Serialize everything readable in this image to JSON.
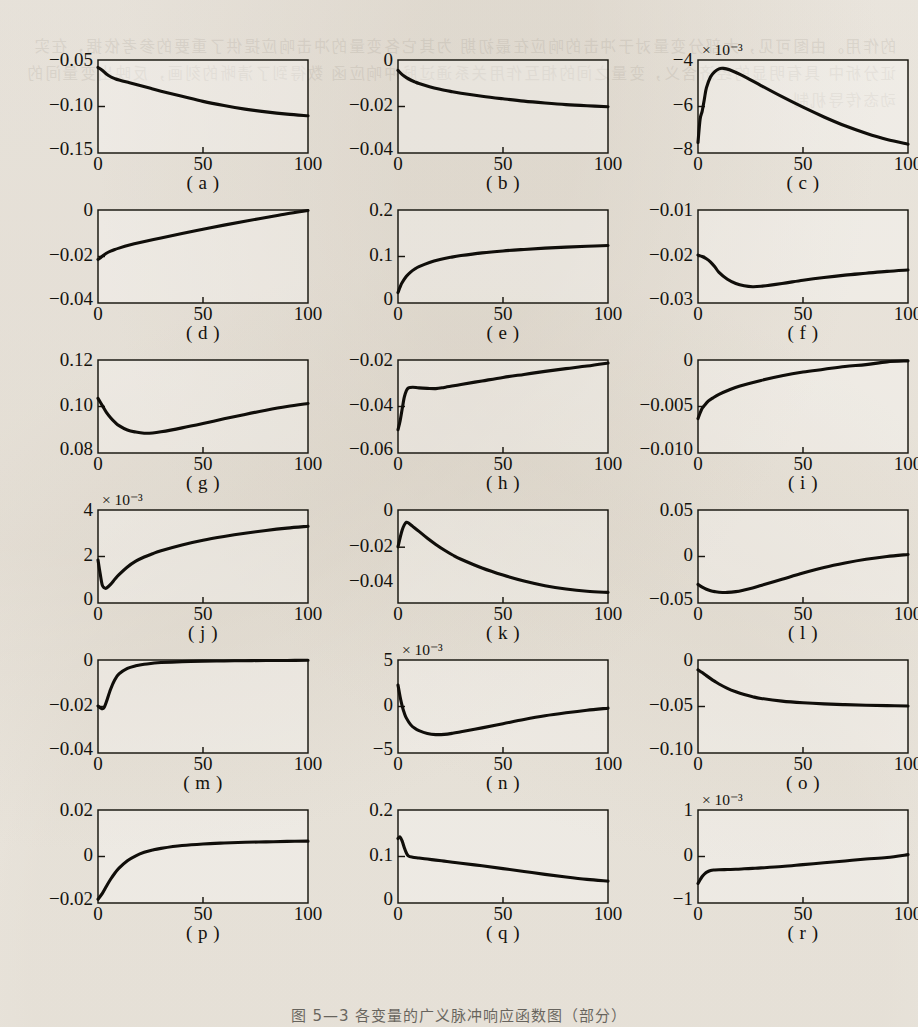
{
  "document": {
    "page_kind": "scanned-book-figure-page",
    "background_color": "#f2efe9",
    "ink_color": "#100e0a",
    "bleed_through_text": "的作用。由图可见，大部分变量对于冲击的响应在最初期 为其它各变量的冲击响应提供了重要的参考依据，在实证分析中 具有明显的经济含义，变量之间的相互作用关系通过脉冲响应函 数得到了清晰的刻画，反映出变量间的动态传导机制",
    "figure_caption": "图 5—3 各变量的广义脉冲响应函数图（部分）"
  },
  "figure": {
    "columns": 3,
    "rows": 6,
    "panel_count": 18,
    "shared_xlabel_ticks": [
      "0",
      "50",
      "100"
    ],
    "xlim": [
      0,
      100
    ]
  },
  "chart_data": [
    {
      "id": "a",
      "type": "line",
      "caption": "( a )",
      "title": "",
      "xlabel": "",
      "ylabel": "",
      "xlim": [
        0,
        100
      ],
      "ylim": [
        -0.15,
        -0.05
      ],
      "xticks": [
        "0",
        "50",
        "100"
      ],
      "yticks": [
        "-0.05",
        "-0.10",
        "-0.15"
      ],
      "ytick_values": [
        -0.05,
        -0.1,
        -0.15
      ],
      "exponent": "",
      "grid": false,
      "legend": null,
      "x": [
        0,
        2,
        4,
        6,
        8,
        10,
        15,
        20,
        25,
        30,
        40,
        50,
        60,
        70,
        80,
        90,
        100
      ],
      "y": [
        -0.058,
        -0.061,
        -0.065,
        -0.068,
        -0.07,
        -0.0715,
        -0.0745,
        -0.0775,
        -0.0805,
        -0.0835,
        -0.089,
        -0.0945,
        -0.099,
        -0.1028,
        -0.1058,
        -0.1082,
        -0.11
      ]
    },
    {
      "id": "b",
      "type": "line",
      "caption": "( b )",
      "title": "",
      "xlabel": "",
      "ylabel": "",
      "xlim": [
        0,
        100
      ],
      "ylim": [
        -0.04,
        0
      ],
      "xticks": [
        "0",
        "50",
        "100"
      ],
      "yticks": [
        "0",
        "-0.02",
        "-0.04"
      ],
      "ytick_values": [
        0,
        -0.02,
        -0.04
      ],
      "exponent": "",
      "grid": false,
      "legend": null,
      "x": [
        0,
        2,
        4,
        6,
        8,
        10,
        15,
        20,
        25,
        30,
        40,
        50,
        60,
        70,
        80,
        90,
        100
      ],
      "y": [
        -0.0045,
        -0.0063,
        -0.0076,
        -0.0086,
        -0.0094,
        -0.0101,
        -0.0115,
        -0.0126,
        -0.0135,
        -0.0143,
        -0.0156,
        -0.0167,
        -0.0177,
        -0.0185,
        -0.0192,
        -0.0197,
        -0.0201
      ]
    },
    {
      "id": "c",
      "type": "line",
      "caption": "( c )",
      "title": "",
      "xlabel": "",
      "ylabel": "",
      "xlim": [
        0,
        100
      ],
      "ylim": [
        -8,
        -4
      ],
      "xticks": [
        "0",
        "50",
        "100"
      ],
      "yticks": [
        "-4",
        "-6",
        "-8"
      ],
      "ytick_values": [
        -4,
        -6,
        -8
      ],
      "exponent": "× 10⁻³",
      "grid": false,
      "legend": null,
      "x": [
        0,
        1,
        2,
        3,
        4,
        6,
        8,
        10,
        12,
        15,
        20,
        25,
        30,
        40,
        50,
        60,
        70,
        80,
        90,
        100
      ],
      "y": [
        -7.55,
        -6.55,
        -6.2,
        -5.7,
        -5.2,
        -4.72,
        -4.5,
        -4.38,
        -4.36,
        -4.42,
        -4.62,
        -4.85,
        -5.1,
        -5.58,
        -6.03,
        -6.45,
        -6.83,
        -7.15,
        -7.42,
        -7.62
      ]
    },
    {
      "id": "d",
      "type": "line",
      "caption": "( d )",
      "title": "",
      "xlabel": "",
      "ylabel": "",
      "xlim": [
        0,
        100
      ],
      "ylim": [
        -0.04,
        0
      ],
      "xticks": [
        "0",
        "50",
        "100"
      ],
      "yticks": [
        "0",
        "-0.02",
        "-0.04"
      ],
      "ytick_values": [
        0,
        -0.02,
        -0.04
      ],
      "exponent": "",
      "grid": false,
      "legend": null,
      "x": [
        0,
        1,
        2,
        4,
        6,
        8,
        10,
        15,
        20,
        30,
        40,
        50,
        60,
        70,
        80,
        90,
        100
      ],
      "y": [
        -0.0213,
        -0.0207,
        -0.0199,
        -0.0186,
        -0.0177,
        -0.017,
        -0.0164,
        -0.0151,
        -0.014,
        -0.012,
        -0.0101,
        -0.0083,
        -0.0065,
        -0.0048,
        -0.0032,
        -0.0016,
        -0.0002
      ]
    },
    {
      "id": "e",
      "type": "line",
      "caption": "( e )",
      "title": "",
      "xlabel": "",
      "ylabel": "",
      "xlim": [
        0,
        100
      ],
      "ylim": [
        0,
        0.2
      ],
      "xticks": [
        "0",
        "50",
        "100"
      ],
      "yticks": [
        "0.2",
        "0.1",
        "0"
      ],
      "ytick_values": [
        0.2,
        0.1,
        0
      ],
      "exponent": "",
      "grid": false,
      "legend": null,
      "x": [
        0,
        1,
        2,
        4,
        6,
        8,
        10,
        15,
        20,
        25,
        30,
        40,
        50,
        60,
        70,
        80,
        90,
        100
      ],
      "y": [
        0.0225,
        0.0345,
        0.044,
        0.0575,
        0.0665,
        0.073,
        0.0782,
        0.0872,
        0.0935,
        0.0982,
        0.102,
        0.1078,
        0.112,
        0.1152,
        0.118,
        0.1202,
        0.122,
        0.1235
      ]
    },
    {
      "id": "f",
      "type": "line",
      "caption": "( f )",
      "title": "",
      "xlabel": "",
      "ylabel": "",
      "xlim": [
        0,
        100
      ],
      "ylim": [
        -0.03,
        -0.01
      ],
      "xticks": [
        "0",
        "50",
        "100"
      ],
      "yticks": [
        "-0.01",
        "-0.02",
        "-0.03"
      ],
      "ytick_values": [
        -0.01,
        -0.02,
        -0.03
      ],
      "exponent": "",
      "grid": false,
      "legend": null,
      "x": [
        0,
        2,
        4,
        6,
        8,
        10,
        14,
        18,
        22,
        26,
        30,
        40,
        50,
        60,
        70,
        80,
        90,
        100
      ],
      "y": [
        -0.0197,
        -0.02,
        -0.0205,
        -0.0212,
        -0.0222,
        -0.0234,
        -0.0249,
        -0.0258,
        -0.0263,
        -0.0265,
        -0.0264,
        -0.0258,
        -0.0251,
        -0.0245,
        -0.024,
        -0.0236,
        -0.0232,
        -0.0229
      ]
    },
    {
      "id": "g",
      "type": "line",
      "caption": "( g )",
      "title": "",
      "xlabel": "",
      "ylabel": "",
      "xlim": [
        0,
        100
      ],
      "ylim": [
        0.08,
        0.12
      ],
      "xticks": [
        "0",
        "50",
        "100"
      ],
      "yticks": [
        "0.12",
        "0.10",
        "0.08"
      ],
      "ytick_values": [
        0.12,
        0.1,
        0.08
      ],
      "exponent": "",
      "grid": false,
      "legend": null,
      "x": [
        0,
        2,
        4,
        6,
        8,
        10,
        14,
        18,
        22,
        26,
        30,
        40,
        50,
        60,
        70,
        80,
        90,
        100
      ],
      "y": [
        0.1035,
        0.1005,
        0.0975,
        0.0952,
        0.0933,
        0.0918,
        0.0899,
        0.089,
        0.0885,
        0.0886,
        0.0891,
        0.0908,
        0.0927,
        0.0947,
        0.0966,
        0.0984,
        0.1,
        0.1013
      ]
    },
    {
      "id": "h",
      "type": "line",
      "caption": "( h )",
      "title": "",
      "xlabel": "",
      "ylabel": "",
      "xlim": [
        0,
        100
      ],
      "ylim": [
        -0.06,
        -0.02
      ],
      "xticks": [
        "0",
        "50",
        "100"
      ],
      "yticks": [
        "-0.02",
        "-0.04",
        "-0.06"
      ],
      "ytick_values": [
        -0.02,
        -0.04,
        -0.06
      ],
      "exponent": "",
      "grid": false,
      "legend": null,
      "x": [
        0,
        1,
        2,
        3,
        4,
        5,
        7,
        10,
        14,
        18,
        22,
        30,
        40,
        50,
        60,
        70,
        80,
        90,
        100
      ],
      "y": [
        -0.05,
        -0.0462,
        -0.041,
        -0.036,
        -0.0332,
        -0.032,
        -0.0317,
        -0.032,
        -0.0322,
        -0.0323,
        -0.0318,
        -0.0305,
        -0.029,
        -0.0275,
        -0.0262,
        -0.0249,
        -0.0237,
        -0.0226,
        -0.0213
      ]
    },
    {
      "id": "i",
      "type": "line",
      "caption": "( i )",
      "title": "",
      "xlabel": "",
      "ylabel": "",
      "xlim": [
        0,
        100
      ],
      "ylim": [
        -0.01,
        0
      ],
      "xticks": [
        "0",
        "50",
        "100"
      ],
      "yticks": [
        "0",
        "-0.005",
        "-0.010"
      ],
      "ytick_values": [
        0,
        -0.005,
        -0.01
      ],
      "exponent": "",
      "grid": false,
      "legend": null,
      "x": [
        0,
        1,
        2,
        3,
        5,
        7,
        10,
        15,
        20,
        30,
        40,
        50,
        60,
        70,
        80,
        90,
        100
      ],
      "y": [
        -0.0063,
        -0.0057,
        -0.0052,
        -0.0049,
        -0.0044,
        -0.0041,
        -0.0037,
        -0.0032,
        -0.0028,
        -0.0022,
        -0.0017,
        -0.0013,
        -0.001,
        -0.0007,
        -0.0005,
        -0.0002,
        -0.0001
      ]
    },
    {
      "id": "j",
      "type": "line",
      "caption": "( j )",
      "title": "",
      "xlabel": "",
      "ylabel": "",
      "xlim": [
        0,
        100
      ],
      "ylim": [
        0,
        4
      ],
      "xticks": [
        "0",
        "50",
        "100"
      ],
      "yticks": [
        "4",
        "2",
        "0"
      ],
      "ytick_values": [
        4,
        2,
        0
      ],
      "exponent": "× 10⁻³",
      "grid": false,
      "legend": null,
      "x": [
        0,
        1,
        2,
        3,
        4,
        6,
        8,
        10,
        14,
        18,
        22,
        26,
        30,
        40,
        50,
        60,
        70,
        80,
        90,
        100
      ],
      "y": [
        1.85,
        1.28,
        0.78,
        0.65,
        0.64,
        0.8,
        1.02,
        1.22,
        1.55,
        1.8,
        1.98,
        2.12,
        2.25,
        2.5,
        2.7,
        2.86,
        3.0,
        3.12,
        3.22,
        3.3
      ]
    },
    {
      "id": "k",
      "type": "line",
      "caption": "( k )",
      "title": "",
      "xlabel": "",
      "ylabel": "",
      "xlim": [
        0,
        100
      ],
      "ylim": [
        -0.05,
        0
      ],
      "xticks": [
        "0",
        "50",
        "100"
      ],
      "yticks": [
        "0",
        "-0.02",
        "-0.04"
      ],
      "ytick_values": [
        0,
        -0.02,
        -0.04
      ],
      "exponent": "",
      "grid": false,
      "legend": null,
      "x": [
        0,
        1,
        2,
        3,
        4,
        5,
        7,
        10,
        14,
        18,
        22,
        26,
        30,
        40,
        50,
        60,
        70,
        80,
        90,
        100
      ],
      "y": [
        -0.0198,
        -0.015,
        -0.0108,
        -0.008,
        -0.0066,
        -0.007,
        -0.0088,
        -0.0115,
        -0.0152,
        -0.0185,
        -0.0215,
        -0.0242,
        -0.0265,
        -0.0312,
        -0.035,
        -0.0382,
        -0.0407,
        -0.0425,
        -0.0437,
        -0.0443
      ]
    },
    {
      "id": "l",
      "type": "line",
      "caption": "( l )",
      "title": "",
      "xlabel": "",
      "ylabel": "",
      "xlim": [
        0,
        100
      ],
      "ylim": [
        -0.05,
        0.05
      ],
      "xticks": [
        "0",
        "50",
        "100"
      ],
      "yticks": [
        "0.05",
        "0",
        "-0.05"
      ],
      "ytick_values": [
        0.05,
        0,
        -0.05
      ],
      "exponent": "",
      "grid": false,
      "legend": null,
      "x": [
        0,
        2,
        4,
        6,
        8,
        10,
        14,
        18,
        22,
        26,
        30,
        40,
        50,
        60,
        70,
        80,
        90,
        100
      ],
      "y": [
        -0.03,
        -0.033,
        -0.0352,
        -0.0368,
        -0.0378,
        -0.0384,
        -0.0386,
        -0.0378,
        -0.036,
        -0.0338,
        -0.0312,
        -0.0245,
        -0.0178,
        -0.0118,
        -0.007,
        -0.003,
        0.0,
        0.0022
      ]
    },
    {
      "id": "m",
      "type": "line",
      "caption": "( m )",
      "title": "",
      "xlabel": "",
      "ylabel": "",
      "xlim": [
        0,
        100
      ],
      "ylim": [
        -0.04,
        0
      ],
      "xticks": [
        "0",
        "50",
        "100"
      ],
      "yticks": [
        "0",
        "-0.02",
        "-0.04"
      ],
      "ytick_values": [
        0,
        -0.02,
        -0.04
      ],
      "exponent": "",
      "grid": false,
      "legend": null,
      "x": [
        0,
        1,
        2,
        3,
        4,
        6,
        8,
        10,
        14,
        18,
        22,
        26,
        30,
        40,
        50,
        60,
        70,
        80,
        90,
        100
      ],
      "y": [
        -0.0198,
        -0.0205,
        -0.021,
        -0.0203,
        -0.018,
        -0.0126,
        -0.0085,
        -0.006,
        -0.0036,
        -0.0025,
        -0.0018,
        -0.0014,
        -0.0011,
        -0.0007,
        -0.0005,
        -0.0004,
        -0.0003,
        -0.0002,
        -0.0002,
        -0.0001
      ]
    },
    {
      "id": "n",
      "type": "line",
      "caption": "( n )",
      "title": "",
      "xlabel": "",
      "ylabel": "",
      "xlim": [
        0,
        100
      ],
      "ylim": [
        -5,
        5
      ],
      "xticks": [
        "0",
        "50",
        "100"
      ],
      "yticks": [
        "5",
        "0",
        "-5"
      ],
      "ytick_values": [
        5,
        0,
        -5
      ],
      "exponent": "× 10⁻³",
      "grid": false,
      "legend": null,
      "x": [
        0,
        1,
        2,
        3,
        4,
        6,
        8,
        10,
        14,
        18,
        22,
        26,
        30,
        40,
        50,
        60,
        70,
        80,
        90,
        100
      ],
      "y": [
        2.3,
        1.05,
        0.05,
        -0.7,
        -1.25,
        -1.95,
        -2.35,
        -2.6,
        -2.9,
        -3.02,
        -3.0,
        -2.88,
        -2.72,
        -2.3,
        -1.85,
        -1.4,
        -1.0,
        -0.68,
        -0.4,
        -0.18
      ]
    },
    {
      "id": "o",
      "type": "line",
      "caption": "( o )",
      "title": "",
      "xlabel": "",
      "ylabel": "",
      "xlim": [
        0,
        100
      ],
      "ylim": [
        -0.1,
        0
      ],
      "xticks": [
        "0",
        "50",
        "100"
      ],
      "yticks": [
        "0",
        "-0.05",
        "-0.10"
      ],
      "ytick_values": [
        0,
        -0.05,
        -0.1
      ],
      "exponent": "",
      "grid": false,
      "legend": null,
      "x": [
        0,
        2,
        4,
        6,
        8,
        10,
        14,
        18,
        22,
        26,
        30,
        40,
        50,
        60,
        70,
        80,
        90,
        100
      ],
      "y": [
        -0.0105,
        -0.0135,
        -0.0168,
        -0.02,
        -0.023,
        -0.0258,
        -0.0305,
        -0.0342,
        -0.0372,
        -0.0395,
        -0.0413,
        -0.0442,
        -0.046,
        -0.0472,
        -0.048,
        -0.0486,
        -0.0491,
        -0.0495
      ]
    },
    {
      "id": "p",
      "type": "line",
      "caption": "( p )",
      "title": "",
      "xlabel": "",
      "ylabel": "",
      "xlim": [
        0,
        100
      ],
      "ylim": [
        -0.02,
        0.02
      ],
      "xticks": [
        "0",
        "50",
        "100"
      ],
      "yticks": [
        "0.02",
        "0",
        "-0.02"
      ],
      "ytick_values": [
        0.02,
        0,
        -0.02
      ],
      "exponent": "",
      "grid": false,
      "legend": null,
      "x": [
        0,
        2,
        4,
        6,
        8,
        10,
        14,
        18,
        22,
        26,
        30,
        40,
        50,
        60,
        70,
        80,
        90,
        100
      ],
      "y": [
        -0.0184,
        -0.016,
        -0.0128,
        -0.0098,
        -0.0072,
        -0.005,
        -0.0018,
        0.0003,
        0.0018,
        0.0028,
        0.0035,
        0.0047,
        0.0054,
        0.0058,
        0.0061,
        0.0063,
        0.0065,
        0.0066
      ]
    },
    {
      "id": "q",
      "type": "line",
      "caption": "( q )",
      "title": "",
      "xlabel": "",
      "ylabel": "",
      "xlim": [
        0,
        100
      ],
      "ylim": [
        0,
        0.2
      ],
      "xticks": [
        "0",
        "50",
        "100"
      ],
      "yticks": [
        "0.2",
        "0.1",
        "0"
      ],
      "ytick_values": [
        0.2,
        0.1,
        0
      ],
      "exponent": "",
      "grid": false,
      "legend": null,
      "x": [
        0,
        1,
        2,
        3,
        4,
        5,
        7,
        10,
        14,
        18,
        22,
        26,
        30,
        40,
        50,
        60,
        70,
        80,
        90,
        100
      ],
      "y": [
        0.1385,
        0.142,
        0.133,
        0.119,
        0.1075,
        0.101,
        0.0985,
        0.0968,
        0.0945,
        0.0922,
        0.09,
        0.0878,
        0.0855,
        0.08,
        0.074,
        0.0678,
        0.0615,
        0.0558,
        0.0508,
        0.047
      ]
    },
    {
      "id": "r",
      "type": "line",
      "caption": "( r )",
      "title": "",
      "xlabel": "",
      "ylabel": "",
      "xlim": [
        0,
        100
      ],
      "ylim": [
        -1,
        1
      ],
      "xticks": [
        "0",
        "50",
        "100"
      ],
      "yticks": [
        "1",
        "0",
        "-1"
      ],
      "ytick_values": [
        1,
        0,
        -1
      ],
      "exponent": "× 10⁻³",
      "grid": false,
      "legend": null,
      "x": [
        0,
        1,
        2,
        3,
        4,
        6,
        8,
        10,
        14,
        18,
        22,
        26,
        30,
        40,
        50,
        60,
        70,
        80,
        90,
        100
      ],
      "y": [
        -0.58,
        -0.5,
        -0.43,
        -0.38,
        -0.34,
        -0.3,
        -0.29,
        -0.285,
        -0.28,
        -0.275,
        -0.265,
        -0.255,
        -0.245,
        -0.215,
        -0.175,
        -0.135,
        -0.095,
        -0.055,
        -0.02,
        0.04
      ]
    }
  ]
}
